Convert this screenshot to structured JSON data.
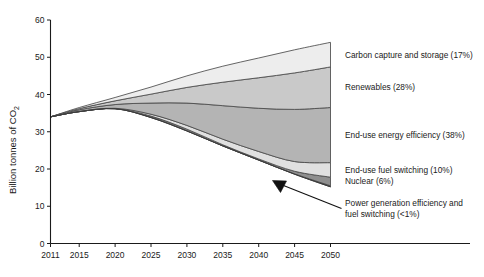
{
  "chart_data": {
    "type": "area",
    "title": "",
    "subtitle": "",
    "xlabel": "",
    "ylabel": "Billion tonnes of CO₂",
    "xlim": [
      2011,
      2050
    ],
    "ylim": [
      0,
      60
    ],
    "grid": false,
    "legend_position": "right-inline",
    "x_ticks": [
      2011,
      2015,
      2020,
      2025,
      2030,
      2035,
      2040,
      2045,
      2050
    ],
    "y_ticks": [
      0,
      10,
      20,
      30,
      40,
      50,
      60
    ],
    "x_tick_labels": [
      "2011",
      "2015",
      "2020",
      "2025",
      "2030",
      "2035",
      "2040",
      "2045",
      "2050"
    ],
    "y_tick_labels": [
      "0",
      "10",
      "20",
      "30",
      "40",
      "50",
      "60"
    ],
    "x": [
      2011,
      2015,
      2020,
      2025,
      2030,
      2035,
      2040,
      2045,
      2050
    ],
    "baseline_note": "Stacked wedges between the reference (upper) emissions path and the abatement (lower) emissions path.",
    "reference_path": [
      34.0,
      36.5,
      39.2,
      42.0,
      45.0,
      47.6,
      49.8,
      52.0,
      54.0
    ],
    "emissions_path": [
      34.0,
      35.4,
      36.2,
      33.8,
      30.2,
      26.2,
      22.4,
      18.6,
      15.2
    ],
    "series": [
      {
        "name": "Carbon capture and storage (17%)",
        "label": "Carbon capture and storage (17%)",
        "share_pct": 17,
        "color": "#ededed",
        "values": [
          0.0,
          0.3,
          0.9,
          1.9,
          3.1,
          4.3,
          5.3,
          6.2,
          6.6
        ]
      },
      {
        "name": "Renewables (28%)",
        "label": "Renewables (28%)",
        "share_pct": 28,
        "color": "#c9c9c9",
        "values": [
          0.0,
          0.3,
          1.0,
          2.4,
          4.2,
          6.3,
          8.2,
          9.8,
          10.9
        ]
      },
      {
        "name": "End-use energy efficiency (38%)",
        "label": "End-use energy efficiency (38%)",
        "share_pct": 38,
        "color": "#b4b4b4",
        "values": [
          0.0,
          0.4,
          1.0,
          3.0,
          6.0,
          9.0,
          11.6,
          14.0,
          14.8
        ]
      },
      {
        "name": "End-use fuel switching (10%)",
        "label": "End-use fuel switching (10%)",
        "share_pct": 10,
        "color": "#e0e0e0",
        "values": [
          0.0,
          0.1,
          0.1,
          0.5,
          1.0,
          1.5,
          2.0,
          2.6,
          3.9
        ]
      },
      {
        "name": "Nuclear (6%)",
        "label": "Nuclear (6%)",
        "share_pct": 6,
        "color": "#8f8f8f",
        "values": [
          0.0,
          0.0,
          0.0,
          0.3,
          0.4,
          0.3,
          0.3,
          0.7,
          2.3
        ]
      },
      {
        "name": "Power generation efficiency and fuel switching (<1%)",
        "label": "Power generation efficiency and fuel switching (<1%)",
        "share_pct": 0.5,
        "color": "#5e5e5e",
        "values": [
          0.0,
          0.0,
          0.0,
          0.1,
          0.1,
          0.0,
          0.0,
          0.1,
          0.3
        ]
      }
    ],
    "annotations": [
      {
        "name": "power-generation-callout",
        "text_line1": "Power generation efficiency and",
        "text_line2": "fuel switching (<1%)",
        "arrow": "points up-left to thin bottom wedge"
      }
    ]
  },
  "legend": {
    "items": [
      {
        "label": "Carbon capture and storage (17%)",
        "swatch": "#ededed"
      },
      {
        "label": "Renewables (28%)",
        "swatch": "#c9c9c9"
      },
      {
        "label": "End-use energy efficiency (38%)",
        "swatch": "#b4b4b4"
      },
      {
        "label": "End-use fuel switching (10%)",
        "swatch": "#e0e0e0"
      },
      {
        "label": "Nuclear (6%)",
        "swatch": "#8f8f8f"
      }
    ],
    "callout_line1": "Power generation efficiency and",
    "callout_line2": "fuel switching (<1%)"
  },
  "axes": {
    "y_title": "Billion tonnes of CO₂",
    "y_title_main": "Billion tonnes of CO",
    "y_title_sub": "2"
  }
}
